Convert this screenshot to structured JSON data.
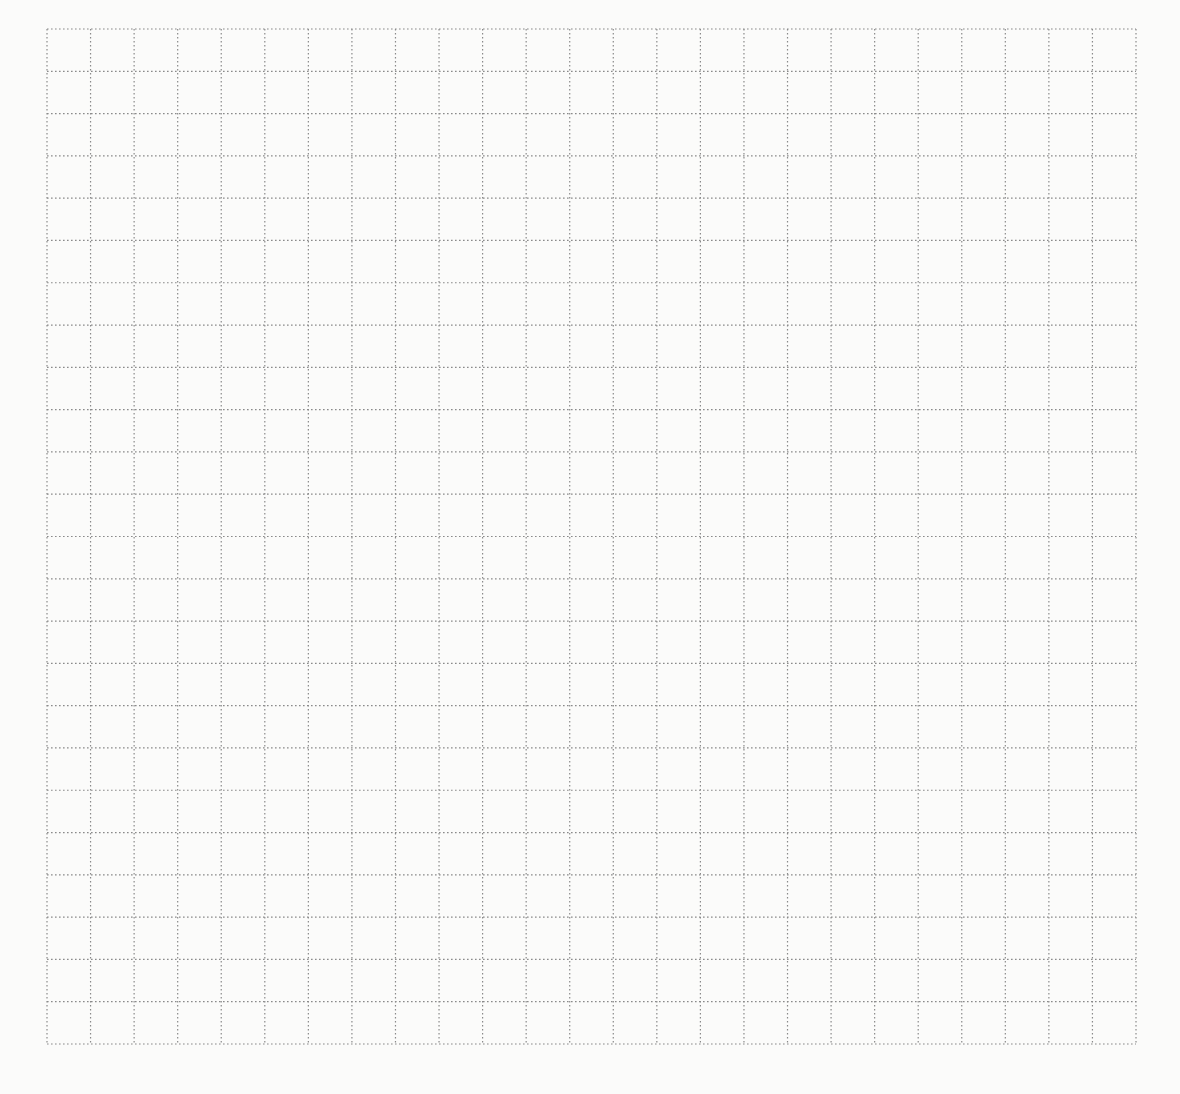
{
  "page": {
    "type": "dotted-grid-paper",
    "background_color": "#fbfbfa",
    "line_color": "#8a8a8a"
  },
  "grid": {
    "columns": 25,
    "rows": 24,
    "cell_width": 43.56,
    "cell_height": 42.29,
    "origin_x": 46,
    "origin_y": 28,
    "width": 1089,
    "height": 1015,
    "line_style": "dotted"
  }
}
